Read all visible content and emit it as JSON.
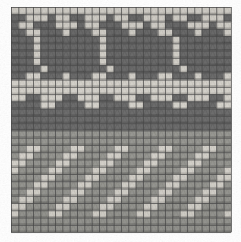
{
  "image": {
    "title": "Knitted textile swatch",
    "description": "Grayscale photograph of a stranded-colorwork knit fabric showing a stitch grid with three horizontal pattern bands",
    "width": 241,
    "height": 242,
    "background_color": "#ffffff"
  },
  "grid": {
    "origin_x": 11,
    "origin_y": 7,
    "columns": 30,
    "rows": 31,
    "cell_width": 7.33,
    "cell_height": 7.26,
    "stitch_line_color": "#4a4a4a",
    "stitch_line_width": 0.9
  },
  "palette": {
    "light_yarn": "#d9d6cf",
    "light_yarn_shade": "#c3c0b8",
    "dark_yarn": "#6e6e6e",
    "dark_yarn_shade": "#5a5a5a",
    "mid_yarn": "#9a9a95",
    "grid_line": "#4a4a4a",
    "paper": "#ffffff"
  },
  "bands": [
    {
      "name": "top-motif-band",
      "label": "Large dark motif band",
      "row_start": 0,
      "row_end": 11,
      "description": "Repeating dark arch / cross motifs on light ground"
    },
    {
      "name": "middle-stripe-band",
      "label": "Toothed horizontal stripe band",
      "row_start": 12,
      "row_end": 18,
      "description": "Solid dark bar with alternating toothed light notches above and below"
    },
    {
      "name": "bottom-twill-band",
      "label": "Diagonal twill check band",
      "row_start": 19,
      "row_end": 30,
      "description": "Light squares stepping diagonally across a mid-tone ground"
    }
  ],
  "chart_data": {
    "type": "heatmap",
    "xlabel": "stitch column",
    "ylabel": "stitch row",
    "columns": 30,
    "rows": 31,
    "legend": [
      {
        "key": 0,
        "name": "light yarn",
        "color": "#d9d6cf"
      },
      {
        "key": 1,
        "name": "dark yarn",
        "color": "#6e6e6e"
      },
      {
        "key": 2,
        "name": "mid yarn",
        "color": "#9a9a95"
      }
    ],
    "cells": [
      [
        0,
        0,
        0,
        0,
        0,
        0,
        0,
        0,
        0,
        0,
        0,
        0,
        0,
        0,
        0,
        0,
        0,
        0,
        0,
        0,
        0,
        0,
        0,
        0,
        0,
        0,
        0,
        0,
        0,
        0
      ],
      [
        1,
        1,
        0,
        0,
        0,
        1,
        0,
        0,
        1,
        1,
        0,
        0,
        0,
        1,
        0,
        0,
        1,
        1,
        0,
        0,
        0,
        1,
        0,
        0,
        1,
        1,
        0,
        0,
        0,
        1
      ],
      [
        1,
        0,
        0,
        1,
        1,
        1,
        0,
        0,
        0,
        1,
        0,
        0,
        1,
        1,
        1,
        0,
        0,
        0,
        1,
        0,
        0,
        1,
        1,
        1,
        0,
        0,
        0,
        1,
        0,
        0
      ],
      [
        1,
        1,
        0,
        0,
        1,
        1,
        1,
        0,
        1,
        1,
        1,
        0,
        0,
        1,
        1,
        1,
        0,
        1,
        1,
        1,
        0,
        0,
        1,
        1,
        1,
        0,
        1,
        1,
        1,
        0
      ],
      [
        1,
        1,
        1,
        0,
        1,
        1,
        1,
        1,
        1,
        1,
        1,
        1,
        0,
        1,
        1,
        1,
        1,
        1,
        1,
        1,
        1,
        1,
        0,
        1,
        1,
        1,
        1,
        1,
        1,
        1
      ],
      [
        1,
        1,
        1,
        0,
        1,
        1,
        1,
        1,
        1,
        1,
        1,
        1,
        0,
        1,
        1,
        1,
        1,
        1,
        1,
        1,
        1,
        1,
        0,
        1,
        1,
        1,
        1,
        1,
        1,
        1
      ],
      [
        1,
        1,
        1,
        0,
        1,
        1,
        1,
        1,
        1,
        1,
        1,
        1,
        0,
        1,
        1,
        1,
        1,
        1,
        1,
        1,
        1,
        1,
        0,
        1,
        1,
        1,
        1,
        1,
        1,
        1
      ],
      [
        1,
        1,
        1,
        0,
        1,
        1,
        1,
        1,
        1,
        1,
        1,
        1,
        0,
        1,
        1,
        1,
        1,
        1,
        1,
        1,
        1,
        1,
        0,
        1,
        1,
        1,
        1,
        1,
        1,
        1
      ],
      [
        1,
        1,
        1,
        1,
        0,
        1,
        1,
        1,
        1,
        1,
        1,
        1,
        1,
        0,
        1,
        1,
        1,
        1,
        1,
        1,
        1,
        1,
        1,
        0,
        1,
        1,
        1,
        1,
        1,
        1
      ],
      [
        1,
        1,
        0,
        0,
        1,
        1,
        1,
        0,
        1,
        1,
        1,
        0,
        0,
        1,
        1,
        1,
        0,
        1,
        1,
        1,
        0,
        0,
        1,
        1,
        1,
        0,
        1,
        1,
        1,
        0
      ],
      [
        0,
        0,
        0,
        0,
        0,
        0,
        0,
        0,
        0,
        0,
        0,
        0,
        0,
        0,
        0,
        0,
        0,
        0,
        0,
        0,
        0,
        0,
        0,
        0,
        0,
        0,
        0,
        0,
        0,
        0
      ],
      [
        0,
        0,
        0,
        0,
        0,
        0,
        0,
        0,
        0,
        0,
        0,
        0,
        0,
        0,
        0,
        0,
        0,
        0,
        0,
        0,
        0,
        0,
        0,
        0,
        0,
        0,
        0,
        0,
        0,
        0
      ],
      [
        0,
        0,
        1,
        1,
        0,
        0,
        0,
        1,
        1,
        0,
        0,
        0,
        1,
        1,
        0,
        0,
        0,
        1,
        1,
        0,
        0,
        0,
        1,
        1,
        0,
        0,
        0,
        1,
        1,
        0
      ],
      [
        1,
        1,
        1,
        1,
        0,
        0,
        1,
        1,
        1,
        1,
        0,
        0,
        1,
        1,
        1,
        1,
        0,
        0,
        1,
        1,
        1,
        1,
        0,
        0,
        1,
        1,
        1,
        1,
        0,
        0
      ],
      [
        1,
        1,
        1,
        1,
        1,
        1,
        1,
        1,
        1,
        1,
        1,
        1,
        1,
        1,
        1,
        1,
        1,
        1,
        1,
        1,
        1,
        1,
        1,
        1,
        1,
        1,
        1,
        1,
        1,
        1
      ],
      [
        1,
        1,
        1,
        1,
        1,
        1,
        1,
        1,
        1,
        1,
        1,
        1,
        1,
        1,
        1,
        1,
        1,
        1,
        1,
        1,
        1,
        1,
        1,
        1,
        1,
        1,
        1,
        1,
        1,
        1
      ],
      [
        1,
        1,
        1,
        1,
        1,
        1,
        1,
        1,
        1,
        1,
        1,
        1,
        1,
        1,
        1,
        1,
        1,
        1,
        1,
        1,
        1,
        1,
        1,
        1,
        1,
        1,
        1,
        1,
        1,
        1
      ],
      [
        2,
        2,
        2,
        2,
        2,
        2,
        2,
        2,
        2,
        2,
        2,
        2,
        2,
        2,
        2,
        2,
        2,
        2,
        2,
        2,
        2,
        2,
        2,
        2,
        2,
        2,
        2,
        2,
        2,
        2
      ],
      [
        2,
        2,
        2,
        2,
        2,
        2,
        2,
        2,
        2,
        2,
        2,
        2,
        2,
        2,
        2,
        2,
        2,
        2,
        2,
        2,
        2,
        2,
        2,
        2,
        2,
        2,
        2,
        2,
        2,
        2
      ],
      [
        2,
        2,
        0,
        0,
        2,
        2,
        2,
        2,
        0,
        0,
        2,
        2,
        2,
        2,
        0,
        0,
        2,
        2,
        2,
        2,
        0,
        0,
        2,
        2,
        2,
        2,
        0,
        0,
        2,
        2
      ],
      [
        2,
        0,
        0,
        2,
        2,
        2,
        2,
        0,
        0,
        2,
        2,
        2,
        2,
        0,
        0,
        2,
        2,
        2,
        2,
        0,
        0,
        2,
        2,
        2,
        2,
        0,
        0,
        2,
        2,
        2
      ],
      [
        0,
        0,
        2,
        2,
        2,
        2,
        0,
        0,
        2,
        2,
        2,
        2,
        0,
        0,
        2,
        2,
        2,
        2,
        0,
        0,
        2,
        2,
        2,
        2,
        0,
        0,
        2,
        2,
        2,
        2
      ],
      [
        0,
        2,
        2,
        2,
        2,
        0,
        0,
        2,
        2,
        2,
        2,
        0,
        0,
        2,
        2,
        2,
        2,
        0,
        0,
        2,
        2,
        2,
        2,
        0,
        0,
        2,
        2,
        2,
        2,
        0
      ],
      [
        2,
        2,
        2,
        2,
        0,
        0,
        2,
        2,
        2,
        2,
        0,
        0,
        2,
        2,
        2,
        2,
        0,
        0,
        2,
        2,
        2,
        2,
        0,
        0,
        2,
        2,
        2,
        2,
        0,
        0
      ],
      [
        2,
        2,
        2,
        0,
        0,
        2,
        2,
        2,
        2,
        0,
        0,
        2,
        2,
        2,
        2,
        0,
        0,
        2,
        2,
        2,
        2,
        0,
        0,
        2,
        2,
        2,
        2,
        0,
        0,
        2
      ],
      [
        2,
        2,
        0,
        0,
        2,
        2,
        2,
        2,
        0,
        0,
        2,
        2,
        2,
        2,
        0,
        0,
        2,
        2,
        2,
        2,
        0,
        0,
        2,
        2,
        2,
        2,
        0,
        0,
        2,
        2
      ],
      [
        2,
        0,
        0,
        2,
        2,
        2,
        2,
        0,
        0,
        2,
        2,
        2,
        2,
        0,
        0,
        2,
        2,
        2,
        2,
        0,
        0,
        2,
        2,
        2,
        2,
        0,
        0,
        2,
        2,
        2
      ],
      [
        0,
        0,
        2,
        2,
        2,
        2,
        0,
        0,
        2,
        2,
        2,
        2,
        0,
        0,
        2,
        2,
        2,
        2,
        0,
        0,
        2,
        2,
        2,
        2,
        0,
        0,
        2,
        2,
        2,
        2
      ],
      [
        0,
        2,
        2,
        2,
        2,
        0,
        0,
        2,
        2,
        2,
        2,
        0,
        0,
        2,
        2,
        2,
        2,
        0,
        0,
        2,
        2,
        2,
        2,
        0,
        0,
        2,
        2,
        2,
        2,
        0
      ],
      [
        2,
        2,
        2,
        2,
        2,
        2,
        2,
        2,
        2,
        2,
        2,
        2,
        2,
        2,
        2,
        2,
        2,
        2,
        2,
        2,
        2,
        2,
        2,
        2,
        2,
        2,
        2,
        2,
        2,
        2
      ],
      [
        2,
        2,
        2,
        2,
        2,
        2,
        2,
        2,
        2,
        2,
        2,
        2,
        2,
        2,
        2,
        2,
        2,
        2,
        2,
        2,
        2,
        2,
        2,
        2,
        2,
        2,
        2,
        2,
        2,
        2
      ]
    ]
  }
}
